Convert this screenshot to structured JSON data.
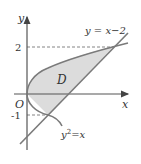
{
  "diagram": {
    "type": "region-between-curves",
    "axes": {
      "x_label": "x",
      "y_label": "y",
      "origin_label": "O"
    },
    "tick_labels": {
      "y_pos": "2",
      "y_neg": "-1"
    },
    "curves": [
      {
        "name": "line",
        "label": "y = x−2",
        "equation": "y = x - 2"
      },
      {
        "name": "parabola",
        "label_base": "y",
        "label_sup": "2",
        "label_rest": "=x",
        "equation": "y^2 = x"
      }
    ],
    "region": {
      "label": "D",
      "fill": "#d9d9d9"
    },
    "intersections": [
      {
        "x": 1,
        "y": -1
      },
      {
        "x": 4,
        "y": 2
      }
    ],
    "colors": {
      "curve": "#7a7a7a",
      "axis": "#555555",
      "dashed": "#666666",
      "fill": "#dcdcdc"
    }
  }
}
